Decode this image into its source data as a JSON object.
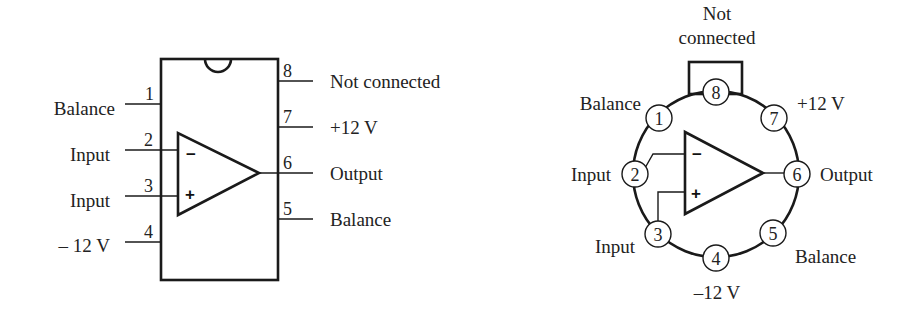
{
  "dip_package": {
    "pins": [
      {
        "number": "1",
        "label": "Balance"
      },
      {
        "number": "2",
        "label": "Input",
        "opamp_terminal": "−"
      },
      {
        "number": "3",
        "label": "Input",
        "opamp_terminal": "+"
      },
      {
        "number": "4",
        "label": "– 12 V"
      },
      {
        "number": "5",
        "label": "Balance"
      },
      {
        "number": "6",
        "label": "Output"
      },
      {
        "number": "7",
        "label": "+12 V"
      },
      {
        "number": "8",
        "label": "Not connected"
      }
    ],
    "minus_sign": "−",
    "plus_sign": "+"
  },
  "can_package": {
    "pins": [
      {
        "number": "1",
        "label": "Balance"
      },
      {
        "number": "2",
        "label": "Input",
        "opamp_terminal": "−"
      },
      {
        "number": "3",
        "label": "Input",
        "opamp_terminal": "+"
      },
      {
        "number": "4",
        "label": "–12 V"
      },
      {
        "number": "5",
        "label": "Balance"
      },
      {
        "number": "6",
        "label": "Output"
      },
      {
        "number": "7",
        "label": "+12 V"
      },
      {
        "number": "8",
        "label_line1": "Not",
        "label_line2": "connected"
      }
    ],
    "minus_sign": "−",
    "plus_sign": "+"
  }
}
